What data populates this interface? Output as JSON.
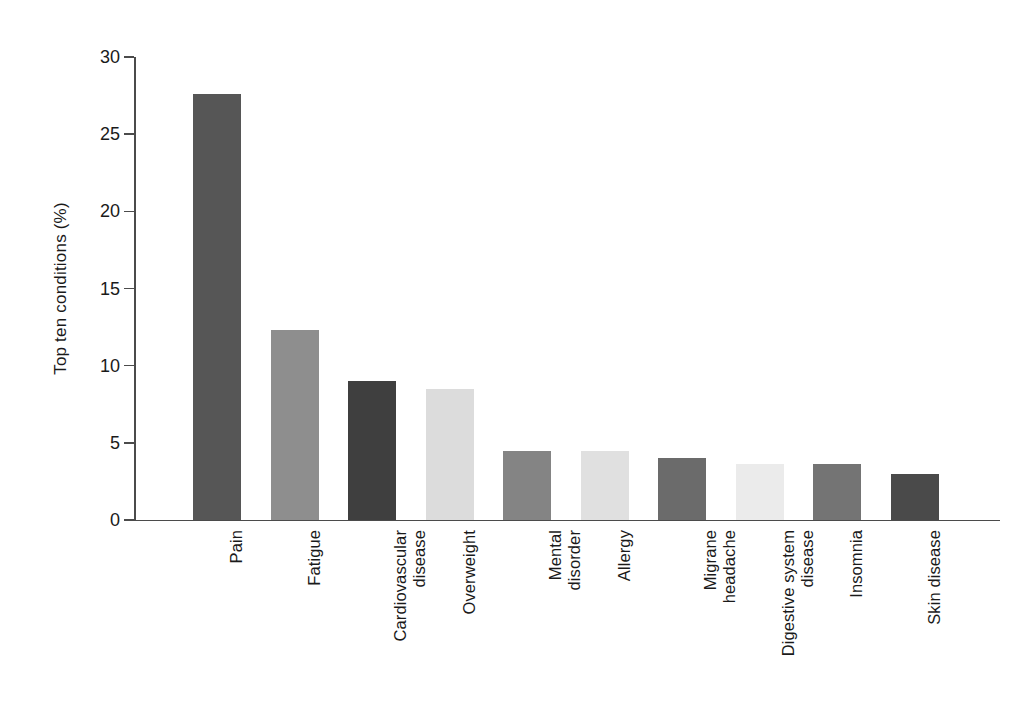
{
  "chart_data": {
    "type": "bar",
    "title": "",
    "subtitle": "",
    "xlabel": "",
    "ylabel": "Top ten conditions (%)",
    "ylim": [
      0,
      30
    ],
    "yticks": [
      0,
      5,
      10,
      15,
      20,
      25,
      30
    ],
    "ytick_labels": [
      "0",
      "5",
      "10",
      "15",
      "20",
      "25",
      "30"
    ],
    "grid": false,
    "legend": "none",
    "categories": [
      "Pain",
      "Fatigue",
      "Cardiovascular disease",
      "Overweight",
      "Mental disorder",
      "Allergy",
      "Migrane headache",
      "Digestive system disease",
      "Insomnia",
      "Skin disease"
    ],
    "category_label_lines": [
      [
        "Pain"
      ],
      [
        "Fatigue"
      ],
      [
        "Cardiovascular",
        "disease"
      ],
      [
        "Overweight"
      ],
      [
        "Mental",
        "disorder"
      ],
      [
        "Allergy"
      ],
      [
        "Migrane",
        "headache"
      ],
      [
        "Digestive system",
        "disease"
      ],
      [
        "Insomnia"
      ],
      [
        "Skin disease"
      ]
    ],
    "values": [
      27.6,
      12.3,
      9.0,
      8.5,
      4.5,
      4.5,
      4.0,
      3.6,
      3.6,
      3.0
    ],
    "bar_colors": [
      "#565656",
      "#8e8e8e",
      "#3f3f3f",
      "#dcdcdc",
      "#848484",
      "#e0e0e0",
      "#6b6b6b",
      "#ebebeb",
      "#747474",
      "#4a4a4a"
    ]
  },
  "axis": {
    "line_color": "#4b4b4b"
  }
}
